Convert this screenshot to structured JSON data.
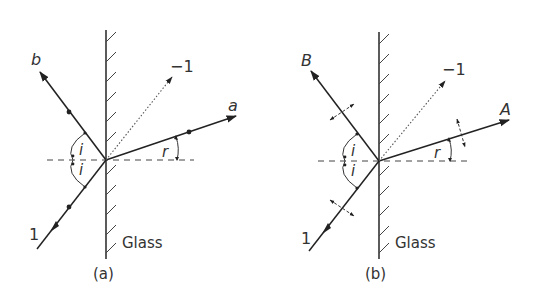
{
  "figure": {
    "panels": [
      {
        "id": "a",
        "caption": "(a)",
        "surface_label": "Glass",
        "incident_label": "1",
        "reflected_label": "b",
        "refracted_label": "a",
        "reversed_label": "−1",
        "angle_incidence_label": "i",
        "angle_reflection_label": "i",
        "angle_refraction_label": "r",
        "polarization_marker": "dots"
      },
      {
        "id": "b",
        "caption": "(b)",
        "surface_label": "Glass",
        "incident_label": "1",
        "reflected_label": "B",
        "refracted_label": "A",
        "reversed_label": "−1",
        "angle_incidence_label": "i",
        "angle_reflection_label": "i",
        "angle_refraction_label": "r",
        "polarization_marker": "double-arrows"
      }
    ]
  }
}
